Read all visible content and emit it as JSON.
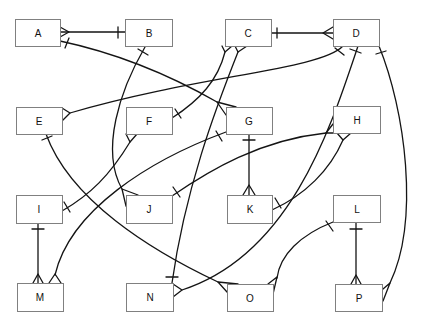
{
  "diagram": {
    "type": "entity-relationship",
    "notation": "crow's foot (bar = one, crow's foot = many)",
    "entities": [
      {
        "id": "A",
        "label": "A"
      },
      {
        "id": "B",
        "label": "B"
      },
      {
        "id": "C",
        "label": "C"
      },
      {
        "id": "D",
        "label": "D"
      },
      {
        "id": "E",
        "label": "E"
      },
      {
        "id": "F",
        "label": "F"
      },
      {
        "id": "G",
        "label": "G"
      },
      {
        "id": "H",
        "label": "H"
      },
      {
        "id": "I",
        "label": "I"
      },
      {
        "id": "J",
        "label": "J"
      },
      {
        "id": "K",
        "label": "K"
      },
      {
        "id": "L",
        "label": "L"
      },
      {
        "id": "M",
        "label": "M"
      },
      {
        "id": "N",
        "label": "N"
      },
      {
        "id": "O",
        "label": "O"
      },
      {
        "id": "P",
        "label": "P"
      }
    ],
    "relationships": [
      {
        "from": "A",
        "to": "B",
        "from_end": "many",
        "to_end": "one",
        "path": "M60,32 L125,32",
        "from_marker": "M60,27 L69,32 L60,37",
        "to_marker": "M118,27 L118,38"
      },
      {
        "from": "A",
        "to": "G",
        "from_end": "one",
        "to_end": "many",
        "path": "M60,41 Q140,58 217,102",
        "from_marker": "M65,48 L69,38",
        "to_marker": "M236,107 L217,102 L226,115"
      },
      {
        "from": "B",
        "to": "J",
        "from_end": "one",
        "to_end": "many",
        "path": "M145,47 C120,90 100,150 122,189",
        "from_marker": "M138,49 L148,55",
        "to_marker": "M126,206 L122,189 L138,195"
      },
      {
        "from": "C",
        "to": "D",
        "from_end": "one",
        "to_end": "many",
        "path": "M271,33 L333,33",
        "from_marker": "M277,28 L277,38",
        "to_marker": "M333,27 L323,33 L333,39"
      },
      {
        "from": "C",
        "to": "F",
        "from_end": "many",
        "to_end": "one",
        "path": "M225,52 C218,80 200,100 172,118",
        "from_marker": "M222,46 L225,52 L232,46",
        "to_marker": "M175,109 L181,118"
      },
      {
        "from": "C",
        "to": "N",
        "from_end": "many",
        "to_end": "one",
        "path": "M238,52 C215,110 185,190 172,283",
        "from_marker": "M235,46 L238,52 L247,46",
        "to_marker": "M166,277 L178,277"
      },
      {
        "from": "D",
        "to": "E",
        "from_end": "one",
        "to_end": "many",
        "path": "M343,46 C320,70 200,75 70,113",
        "from_marker": "M335,48 L344,55",
        "to_marker": "M62,108 L70,113 L62,121"
      },
      {
        "from": "D",
        "to": "N",
        "from_end": "one",
        "to_end": "many",
        "path": "M358,46 C330,130 290,255 182,290",
        "from_marker": "M350,49 L361,53",
        "to_marker": "M173,284 L182,290 L173,297"
      },
      {
        "from": "D",
        "to": "P",
        "from_end": "one",
        "to_end": "many",
        "path": "M379,46 C405,110 420,220 390,283",
        "from_marker": "M376,54 L386,51",
        "to_marker": "M383,289 L390,283 L383,301"
      },
      {
        "from": "E",
        "to": "O",
        "from_end": "one",
        "to_end": "many",
        "path": "M46,134 C70,200 150,250 218,282",
        "from_marker": "M42,140 L52,136",
        "to_marker": "M238,284 L218,282 L227,292"
      },
      {
        "from": "F",
        "to": "I",
        "from_end": "many",
        "to_end": "one",
        "path": "M130,142 C110,175 90,195 62,211",
        "from_marker": "M126,134 L130,142 L137,134",
        "to_marker": "M64,202 L70,212"
      },
      {
        "from": "G",
        "to": "K",
        "from_end": "one",
        "to_end": "many",
        "path": "M249,134 L249,195",
        "from_marker": "M243,140 L255,140",
        "to_marker": "M243,195 L249,185 L255,195"
      },
      {
        "from": "G",
        "to": "M",
        "from_end": "one",
        "to_end": "many",
        "path": "M226,132 C150,160 70,210 55,275",
        "from_marker": "M216,131 L222,141",
        "to_marker": "M49,283 L55,274 L61,283"
      },
      {
        "from": "H",
        "to": "J",
        "from_end": "many",
        "to_end": "one",
        "path": "M326,133 C260,140 210,170 172,196",
        "from_marker": "M333,124 L326,133 L341,133",
        "to_marker": "M173,187 L180,197"
      },
      {
        "from": "H",
        "to": "K",
        "from_end": "many",
        "to_end": "one",
        "path": "M343,140 C330,170 305,195 272,210",
        "from_marker": "M337,133 L343,140 L351,133",
        "to_marker": "M275,198 L281,208"
      },
      {
        "from": "I",
        "to": "M",
        "from_end": "one",
        "to_end": "many",
        "path": "M38,223 L38,283",
        "from_marker": "M32,229 L44,229",
        "to_marker": "M33,283 L38,274 L43,283"
      },
      {
        "from": "L",
        "to": "O",
        "from_end": "one",
        "to_end": "many",
        "path": "M333,222 C300,235 280,255 277,278",
        "from_marker": "M326,221 L333,231",
        "to_marker": "M268,284 L277,277 L273,294"
      },
      {
        "from": "L",
        "to": "P",
        "from_end": "one",
        "to_end": "many",
        "path": "M356,222 L356,284",
        "from_marker": "M350,229 L362,229",
        "to_marker": "M351,284 L356,275 L361,284"
      }
    ]
  }
}
